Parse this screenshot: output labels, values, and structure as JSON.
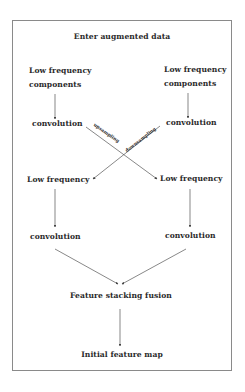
{
  "diagram": {
    "title": "Enter augmented data",
    "left_branch": {
      "input_line1": "Low frequency",
      "input_line2": "components",
      "conv1": "convolution",
      "mid": "Low frequency",
      "conv2": "convolution"
    },
    "right_branch": {
      "input_line1": "Low frequency",
      "input_line2": "components",
      "conv1": "convolution",
      "mid": "Low frequency",
      "conv2": "convolution"
    },
    "cross_labels": {
      "upsampling": "upsampling",
      "downsampling": "downsampling"
    },
    "fusion": "Feature stacking fusion",
    "output": "Initial feature map"
  },
  "colors": {
    "line": "#555555",
    "frame": "#8a8a8a",
    "text": "#2a2a2a"
  }
}
